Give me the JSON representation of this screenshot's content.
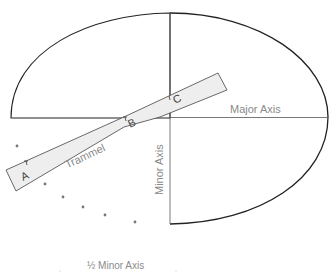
{
  "diagram": {
    "labels": {
      "major_axis": "Major Axis",
      "minor_axis": "Minor Axis",
      "half_minor_axis": "½ Minor Axis",
      "trammel": "Trammel"
    },
    "points": {
      "a": "A",
      "b": "B",
      "c": "C"
    },
    "colors": {
      "outline": "#222222",
      "axis": "#555555",
      "trammel_fill": "#eeeeee",
      "label": "#8a8a8a",
      "dot": "#777777"
    }
  }
}
